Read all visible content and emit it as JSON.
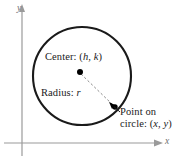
{
  "figure": {
    "type": "geometry-diagram",
    "axes": {
      "x_label": "x",
      "y_label": "y",
      "origin_px": [
        22,
        143
      ],
      "x_axis_span_px": [
        4,
        163
      ],
      "y_axis_span_px": [
        10,
        156
      ],
      "arrowheads": [
        "x-positive",
        "y-positive"
      ],
      "color": "#9a9a9a"
    },
    "circle": {
      "center_px": [
        82,
        76
      ],
      "radius_px": 50,
      "stroke_color": "#1a1a1a",
      "stroke_width_px": 2.1,
      "fill": "none"
    },
    "center_point": {
      "label": "Center: (h, k)",
      "label_prefix": "Center: (",
      "var_1": "h",
      "separator": ", ",
      "var_2": "k",
      "label_suffix": ")",
      "dot_px": [
        80,
        72
      ],
      "dot_radius_px": 3
    },
    "radius_segment": {
      "label": "Radius: r",
      "label_prefix": "Radius: ",
      "var": "r",
      "from_px": [
        80,
        72
      ],
      "to_px": [
        115,
        107
      ],
      "style": "dashed",
      "color": "#8a8a8a"
    },
    "circle_point": {
      "label_line_1": "Point on",
      "label_line_2_prefix": "circle: (",
      "label_line_2_var_1": "x",
      "label_line_2_separator": ", ",
      "label_line_2_var_2": "y",
      "label_line_2_suffix": ")",
      "dot_px": [
        115,
        107
      ],
      "dot_radius_px": 2.6,
      "leader_from_px": [
        118,
        110
      ],
      "leader_to_px": [
        110,
        103
      ]
    },
    "colors": {
      "background": "#ffffff",
      "ink": "#1a1a1a",
      "axis": "#9a9a9a",
      "dashed": "#8a8a8a"
    }
  }
}
